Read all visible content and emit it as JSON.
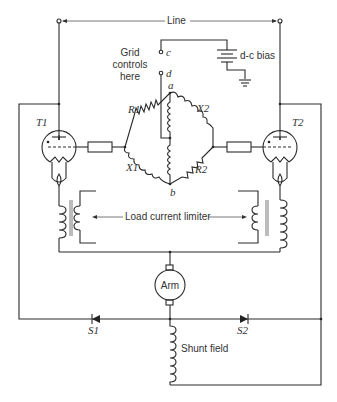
{
  "labels": {
    "line": "Line",
    "grid_controls": [
      "Grid",
      "controls",
      "here"
    ],
    "terminal_c": "c",
    "terminal_d": "d",
    "dc_bias": "d-c bias",
    "node_a": "a",
    "node_b": "b",
    "r1": "R1",
    "r2": "R2",
    "x1": "X1",
    "x2": "X2",
    "t1": "T1",
    "t2": "T2",
    "load_current_limiter": "Load current limiter",
    "armature": "Arm",
    "s1": "S1",
    "s2": "S2",
    "shunt_field": "Shunt field"
  }
}
